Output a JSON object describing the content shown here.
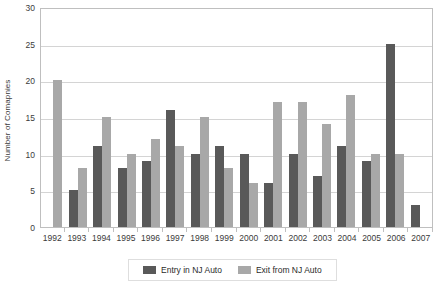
{
  "chart_data": {
    "type": "bar",
    "title": "",
    "subtitle": "",
    "xlabel": "",
    "ylabel": "Number of Comapnies",
    "categories": [
      "1992",
      "1993",
      "1994",
      "1995",
      "1996",
      "1997",
      "1998",
      "1999",
      "2000",
      "2001",
      "2002",
      "2003",
      "2004",
      "2005",
      "2006",
      "2007"
    ],
    "series": [
      {
        "name": "Entry in NJ Auto",
        "color": "#595959",
        "values": [
          0,
          5,
          11,
          8,
          9,
          16,
          10,
          11,
          10,
          6,
          10,
          7,
          11,
          9,
          25,
          3
        ]
      },
      {
        "name": "Exit from NJ Auto",
        "color": "#a8a8a8",
        "values": [
          20,
          8,
          15,
          10,
          12,
          11,
          15,
          8,
          6,
          17,
          17,
          14,
          18,
          10,
          10,
          0
        ]
      }
    ],
    "ylim": [
      0,
      30
    ],
    "y_ticks": [
      0,
      5,
      10,
      15,
      20,
      25,
      30
    ],
    "grid": true,
    "legend_position": "bottom"
  },
  "legend": {
    "entries": [
      {
        "label": "Entry in NJ Auto"
      },
      {
        "label": "Exit from NJ Auto"
      }
    ]
  }
}
